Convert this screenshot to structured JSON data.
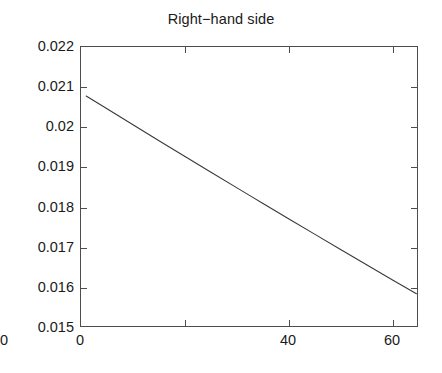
{
  "chart_data": {
    "type": "line",
    "title": "Right−hand side",
    "xlabel": "",
    "ylabel": "",
    "xlim": [
      0,
      65
    ],
    "ylim": [
      0.015,
      0.022
    ],
    "xticks": [
      0,
      20,
      40,
      60
    ],
    "yticks": [
      0.015,
      0.016,
      0.017,
      0.018,
      0.019,
      0.02,
      0.021,
      0.022
    ],
    "xtick_labels": [
      "0",
      "20",
      "40",
      "60"
    ],
    "ytick_labels": [
      "0.015",
      "0.016",
      "0.017",
      "0.018",
      "0.019",
      "0.02",
      "0.021",
      "0.022"
    ],
    "grid": false,
    "legend": null,
    "line_color": "#3a3a3a",
    "line_width": 1.1,
    "background_color": "#ffffff",
    "axes_color": "#4d4d4d",
    "series": [
      {
        "name": "right-hand side",
        "x": [
          1.0,
          5.0,
          10.0,
          15.0,
          20.0,
          25.0,
          30.0,
          32.8,
          35.0,
          40.0,
          45.0,
          50.0,
          55.0,
          60.0,
          64.5
        ],
        "y": [
          0.02078,
          0.02046,
          0.020062,
          0.019666,
          0.019272,
          0.01888,
          0.01849,
          0.018272,
          0.018102,
          0.017716,
          0.017332,
          0.01695,
          0.01657,
          0.016192,
          0.015855
        ]
      }
    ]
  }
}
